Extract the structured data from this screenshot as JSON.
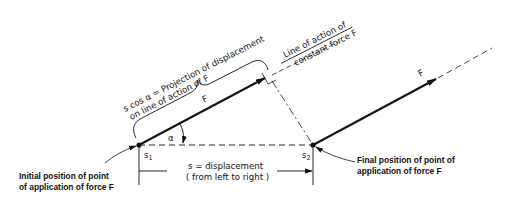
{
  "diagram": {
    "labels": {
      "projection_line1": "s cos α  = Projection of displacement",
      "projection_line2": "on line of action of  F",
      "line_of_action_line1": "Line of action of",
      "line_of_action_line2": "constant force  F",
      "force_initial": "F",
      "force_final": "F",
      "angle": "α",
      "s1": "s",
      "s1_sub": "1",
      "s2": "s",
      "s2_sub": "2",
      "displacement_line1": "s = displacement",
      "displacement_line2": "( from left to right )",
      "initial_caption_line1": "Initial position of point",
      "initial_caption_line2": "of application of  force F",
      "final_caption_line1": "Final position of point of",
      "final_caption_line2": "application of  force F"
    },
    "points": {
      "s1": [
        139,
        145
      ],
      "s2": [
        313,
        145
      ],
      "force_tip_initial": [
        265,
        78
      ],
      "force_tip_final": [
        436,
        79
      ]
    },
    "colors": {
      "ink": "#111111",
      "background": "#ffffff"
    }
  }
}
